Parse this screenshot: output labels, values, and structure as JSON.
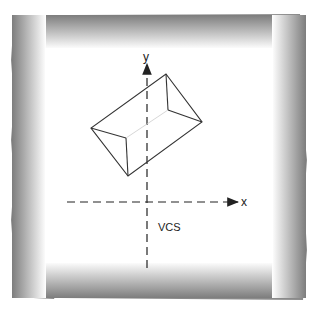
{
  "diagram": {
    "title": "VCS",
    "axes": {
      "x_label": "x",
      "y_label": "y",
      "origin": [
        147,
        202
      ]
    },
    "colors": {
      "frame_outer": "#7a7a7a",
      "frame_inner": "#ffffff",
      "lines": "#333333",
      "background": "#ffffff"
    },
    "shape": {
      "type": "wireframe-box",
      "vertices": {
        "top": [
          166,
          74
        ],
        "right": [
          202,
          122
        ],
        "bottom": [
          128,
          176
        ],
        "left": [
          91,
          128
        ],
        "inner_top": [
          168,
          110
        ],
        "inner_left": [
          126,
          138
        ]
      }
    }
  }
}
